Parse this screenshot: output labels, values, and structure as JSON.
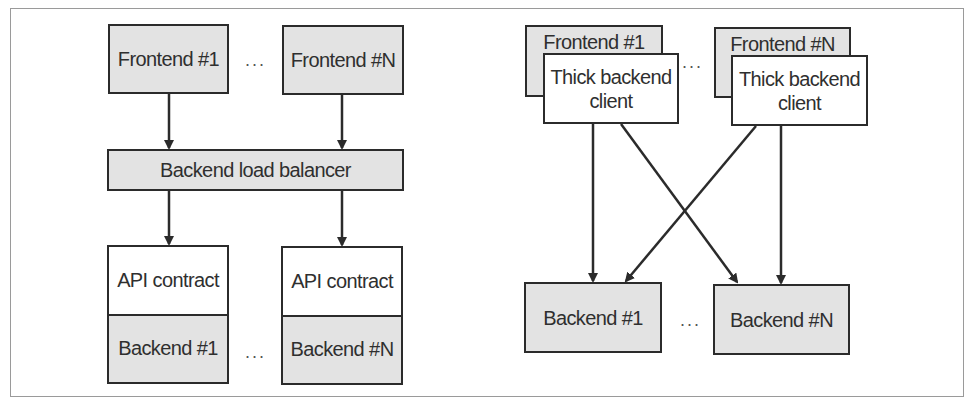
{
  "left_diagram": {
    "frontends": [
      {
        "label": "Frontend #1"
      },
      {
        "label": "Frontend #N"
      }
    ],
    "ellipsis": "...",
    "load_balancer": {
      "label": "Backend load balancer"
    },
    "backends": [
      {
        "api_label": "API contract",
        "label": "Backend #1"
      },
      {
        "api_label": "API contract",
        "label": "Backend #N"
      }
    ]
  },
  "right_diagram": {
    "frontends": [
      {
        "label": "Frontend #1",
        "client_label": "Thick backend client"
      },
      {
        "label": "Frontend #N",
        "client_label": "Thick backend client"
      }
    ],
    "ellipsis": "...",
    "backends": [
      {
        "label": "Backend #1"
      },
      {
        "label": "Backend #N"
      }
    ]
  },
  "colors": {
    "box_fill_gray": "#e3e3e3",
    "box_fill_white": "#ffffff",
    "stroke": "#2b2b2b",
    "frame": "#9a9a9a"
  }
}
